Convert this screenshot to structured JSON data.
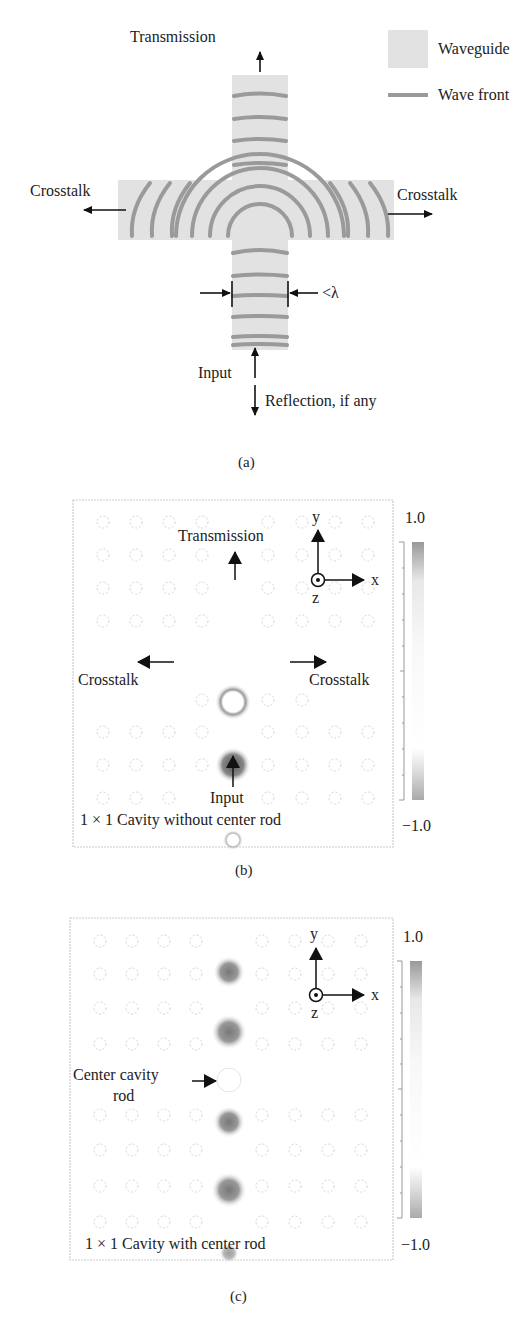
{
  "panel_a": {
    "caption": "(a)",
    "labels": {
      "transmission": "Transmission",
      "crosstalk_left": "Crosstalk",
      "crosstalk_right": "Crosstalk",
      "width": "<λ",
      "input": "Input",
      "reflection": "Reflection, if any"
    },
    "legend": [
      {
        "label": "Waveguide",
        "swatch": "waveguide-fill"
      },
      {
        "label": "Wave front",
        "swatch": "wave-front-line"
      }
    ],
    "colors": {
      "waveguide": "#e2e2e2",
      "wavefront": "#9a9a9a",
      "arrow": "#111111"
    }
  },
  "panel_b": {
    "caption": "(b)",
    "labels": {
      "transmission": "Transmission",
      "crosstalk_left": "Crosstalk",
      "crosstalk_right": "Crosstalk",
      "input": "Input",
      "title": "1 × 1 Cavity without center rod"
    },
    "axes": {
      "y": "y",
      "x": "x",
      "z": "z"
    },
    "colorbar": {
      "max": "1.0",
      "min": "−1.0"
    }
  },
  "panel_c": {
    "caption": "(c)",
    "labels": {
      "center_rod_line1": "Center cavity",
      "center_rod_line2": "rod",
      "title": "1 × 1 Cavity with center rod"
    },
    "axes": {
      "y": "y",
      "x": "x",
      "z": "z"
    },
    "colorbar": {
      "max": "1.0",
      "min": "−1.0"
    }
  }
}
